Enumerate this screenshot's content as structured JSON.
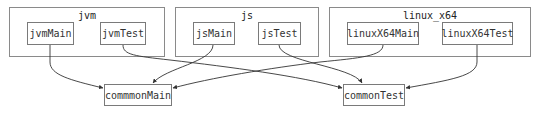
{
  "diagram": {
    "frames": [
      {
        "id": "jvm",
        "label": "jvm"
      },
      {
        "id": "js",
        "label": "js"
      },
      {
        "id": "linux_x64",
        "label": "linux_x64"
      }
    ],
    "nodes": {
      "jvmMain": "jvmMain",
      "jvmTest": "jvmTest",
      "jsMain": "jsMain",
      "jsTest": "jsTest",
      "linuxX64Main": "linuxX64Main",
      "linuxX64Test": "linuxX64Test",
      "commonMain": "commmonMain",
      "commonTest": "commonTest"
    },
    "edges": [
      {
        "from": "jvmMain",
        "to": "commmonMain"
      },
      {
        "from": "jvmTest",
        "to": "commonTest"
      },
      {
        "from": "jsMain",
        "to": "commmonMain"
      },
      {
        "from": "jsTest",
        "to": "commonTest"
      },
      {
        "from": "linuxX64Main",
        "to": "commmonMain"
      },
      {
        "from": "linuxX64Test",
        "to": "commonTest"
      }
    ],
    "colors": {
      "edge": "#333333",
      "frame_border": "#8a8a8a",
      "node_border": "#7a7a7a",
      "background": "#ffffff"
    }
  }
}
